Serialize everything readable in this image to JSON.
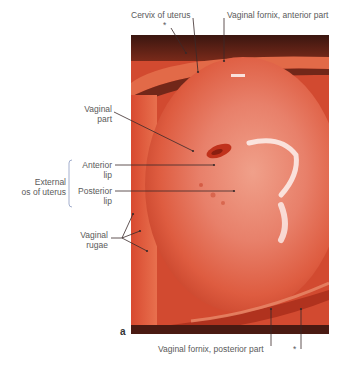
{
  "figure": {
    "panel_letter": "a",
    "photo_description": "Endoscopic view of the cervix of uterus (vaginal part) within the vagina",
    "colors": {
      "tissue_main": "#e2664a",
      "tissue_light": "#f2a68e",
      "tissue_dark": "#a8321e",
      "fornix_shadow": "#4a1a12",
      "label_text": "#5a5a5a",
      "leader_line": "#3a2a2a",
      "bracket": "#9aa6c8"
    }
  },
  "labels": {
    "cervix_of_uterus": "Cervix of uterus",
    "cervix_asterisk": "*",
    "vaginal_fornix_anterior": "Vaginal fornix, anterior part",
    "vaginal_part_line1": "Vaginal",
    "vaginal_part_line2": "part",
    "anterior_lip_line1": "Anterior",
    "anterior_lip_line2": "lip",
    "posterior_lip_line1": "Posterior",
    "posterior_lip_line2": "lip",
    "external_os_line1": "External",
    "external_os_line2": "os of uterus",
    "vaginal_rugae_line1": "Vaginal",
    "vaginal_rugae_line2": "rugae",
    "vaginal_fornix_posterior": "Vaginal fornix, posterior part",
    "posterior_asterisk": "*"
  }
}
